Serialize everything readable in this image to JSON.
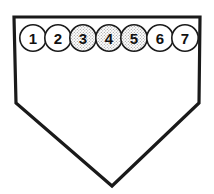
{
  "diagram": {
    "name": "home-plate-base-diagram",
    "shape": {
      "name": "home-plate-pentagon",
      "outline_color": "#1a1a1a",
      "fill_color": "#ffffff",
      "stroke_width": 3.2,
      "points": "14,17 200,17 199,103 112,186 16,103"
    },
    "markers": [
      {
        "label": "1",
        "cx": 33,
        "cy": 38,
        "r": 13.2,
        "fill": "white",
        "fill_color": "#ffffff"
      },
      {
        "label": "2",
        "cx": 58,
        "cy": 38,
        "r": 13.2,
        "fill": "white",
        "fill_color": "#ffffff"
      },
      {
        "label": "3",
        "cx": 83,
        "cy": 38,
        "r": 13.2,
        "fill": "stipple",
        "fill_color": "#d8d8d8"
      },
      {
        "label": "4",
        "cx": 109,
        "cy": 38,
        "r": 13.2,
        "fill": "stipple",
        "fill_color": "#d8d8d8"
      },
      {
        "label": "5",
        "cx": 134,
        "cy": 38,
        "r": 13.2,
        "fill": "stipple",
        "fill_color": "#d8d8d8"
      },
      {
        "label": "6",
        "cx": 160,
        "cy": 38,
        "r": 13.2,
        "fill": "white",
        "fill_color": "#ffffff"
      },
      {
        "label": "7",
        "cx": 185,
        "cy": 38,
        "r": 13.2,
        "fill": "white",
        "fill_color": "#ffffff"
      }
    ],
    "marker_stroke_color": "#1a1a1a",
    "marker_stroke_width": 1.6
  }
}
